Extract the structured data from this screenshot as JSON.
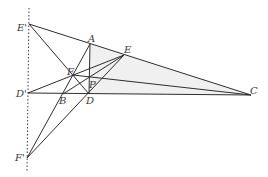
{
  "diagram": {
    "type": "geometry-figure",
    "colors": {
      "line": "#2e2e2e",
      "shade": "#f0f0f0",
      "label": "#3a3a3a"
    },
    "points": {
      "A": {
        "label": "A",
        "x": 90,
        "y": 44
      },
      "B": {
        "label": "B",
        "x": 63,
        "y": 94
      },
      "C": {
        "label": "C",
        "x": 251,
        "y": 95
      },
      "D": {
        "label": "D",
        "x": 89,
        "y": 94
      },
      "E": {
        "label": "E",
        "x": 124,
        "y": 55
      },
      "F": {
        "label": "F",
        "x": 73,
        "y": 75
      },
      "P": {
        "label": "P",
        "x": 89,
        "y": 80
      },
      "D'": {
        "label": "D'",
        "x": 28,
        "y": 93
      },
      "E'": {
        "label": "E'",
        "x": 29,
        "y": 24
      },
      "F'": {
        "label": "F'",
        "x": 27,
        "y": 158
      }
    },
    "labels": {
      "A": "A",
      "B": "B",
      "C": "C",
      "D": "D",
      "E": "E",
      "F": "F",
      "P": "P",
      "Dp": "D'",
      "Ep": "E'",
      "Fp": "F'"
    },
    "segments": [
      [
        "E'",
        "C"
      ],
      [
        "E'",
        "D"
      ],
      [
        "D'",
        "C"
      ],
      [
        "D'",
        "E"
      ],
      [
        "F'",
        "A"
      ],
      [
        "F'",
        "E"
      ],
      [
        "A",
        "D"
      ],
      [
        "B",
        "E"
      ],
      [
        "F",
        "C"
      ]
    ],
    "dotted_line": {
      "x1": 29,
      "y1": 8,
      "x2": 27,
      "y2": 172
    }
  }
}
